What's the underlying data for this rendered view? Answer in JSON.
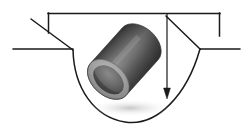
{
  "figure": {
    "name": "pipe-in-trench-cross-section",
    "width": 251,
    "height": 136,
    "background_color": "#ffffff",
    "line_color": "#1a1a1a"
  },
  "colors": {
    "stroke": "#1a1a1a",
    "ground_line": "#222222",
    "pipe_dark": "#4a4a4a",
    "pipe_mid": "#6e6e6e",
    "pipe_light": "#9a9a9a",
    "pipe_highlight": "#b4b4b4",
    "pipe_shadow": "#2e2e2e",
    "end_cap_rim": "#a8a8a8",
    "end_cap_core": "#5c5c5c",
    "trench_fill": "#ffffff"
  },
  "geometry": {
    "ground_left": {
      "x1": 13,
      "y1": 49,
      "x2": 73,
      "y2": 49
    },
    "ground_right": {
      "x1": 200,
      "y1": 49,
      "x2": 240,
      "y2": 49
    },
    "top_bracket": {
      "y": 13,
      "x_start": 48,
      "x_end": 220,
      "left_tick_bottom": 33,
      "right_tick_bottom": 36
    },
    "leader_left": {
      "x1": 31,
      "y1": 19,
      "x2": 73,
      "y2": 50
    },
    "leader_right": {
      "x1": 166,
      "y1": 16,
      "x2": 200,
      "y2": 49
    },
    "depth_arrow": {
      "x": 167,
      "y_top": 14,
      "y_tip": 99
    },
    "trench_path": "M73,50 C74,86 92,116 124,122 C156,127 186,96 200,49",
    "pipe": {
      "center_x": 123,
      "center_y": 63,
      "length": 98,
      "diameter": 48,
      "angle_deg": 42
    }
  },
  "labels": {
    "bracket": "",
    "depth": "",
    "left_leader": "",
    "right_leader": ""
  }
}
